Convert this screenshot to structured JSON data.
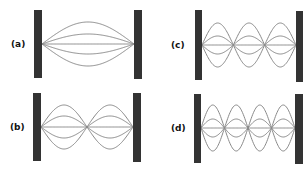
{
  "figure": {
    "colors": {
      "wall": "#333333",
      "string": "#8a8a8a",
      "label": "#111111",
      "background": "#ffffff"
    },
    "panels": [
      {
        "id": "a",
        "label": "(a)",
        "label_pos": {
          "x": 11,
          "y": 39
        },
        "loops": 1,
        "left_wall": {
          "x": 34,
          "y": 10,
          "w": 8,
          "h": 68
        },
        "right_wall": {
          "x": 134,
          "y": 10,
          "w": 8,
          "h": 69
        },
        "string_start_x": 42,
        "string_end_x": 134,
        "center_y": 44,
        "amplitudes": [
          22,
          10,
          0,
          -10,
          -22
        ]
      },
      {
        "id": "b",
        "label": "(b)",
        "label_pos": {
          "x": 10,
          "y": 122
        },
        "loops": 2,
        "left_wall": {
          "x": 33,
          "y": 93,
          "w": 8,
          "h": 68
        },
        "right_wall": {
          "x": 133,
          "y": 93,
          "w": 8,
          "h": 69
        },
        "string_start_x": 41,
        "string_end_x": 133,
        "center_y": 127,
        "amplitudes": [
          22,
          11,
          0,
          -11,
          -22
        ]
      },
      {
        "id": "c",
        "label": "(c)",
        "label_pos": {
          "x": 171,
          "y": 40
        },
        "loops": 3,
        "left_wall": {
          "x": 195,
          "y": 10,
          "w": 7,
          "h": 70
        },
        "right_wall": {
          "x": 296,
          "y": 11,
          "w": 7,
          "h": 71
        },
        "string_start_x": 202,
        "string_end_x": 296,
        "center_y": 45,
        "amplitudes": [
          22,
          9,
          0,
          -9,
          -22
        ]
      },
      {
        "id": "d",
        "label": "(d)",
        "label_pos": {
          "x": 171,
          "y": 123
        },
        "loops": 4,
        "left_wall": {
          "x": 194,
          "y": 94,
          "w": 7,
          "h": 69
        },
        "right_wall": {
          "x": 295,
          "y": 94,
          "w": 8,
          "h": 70
        },
        "string_start_x": 201,
        "string_end_x": 295,
        "center_y": 128,
        "amplitudes": [
          23,
          9,
          0,
          -9,
          -23
        ]
      }
    ]
  }
}
